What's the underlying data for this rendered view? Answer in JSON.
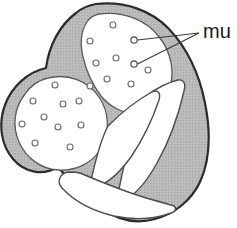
{
  "figure": {
    "kind": "anatomical-diagram",
    "title": ""
  },
  "colors": {
    "muscle_fill": "#b4b4b4",
    "muscle_fill_light": "#c2c2c2",
    "chamber_fill": "#ffffff",
    "outline": "#2b2b2b",
    "inner_outline": "#555555",
    "label_text": "#1a1a1a",
    "leader_line": "#3a3a3a",
    "marker_stroke": "#4a4a4a",
    "background": "#ffffff"
  },
  "labels": {
    "muscle": {
      "text": "mu",
      "note_clipped": "text runs past right edge of image",
      "x": 203,
      "y": 22,
      "font_size": 20
    }
  },
  "leaders": {
    "converge_point": {
      "x": 199,
      "y": 33
    },
    "lines": [
      {
        "name": "leader-upper",
        "x1": 199,
        "y1": 33,
        "x2": 137,
        "y2": 40
      },
      {
        "name": "leader-lower",
        "x1": 199,
        "y1": 33,
        "x2": 137,
        "y2": 64
      }
    ],
    "markers": [
      {
        "name": "marker-upper",
        "cx": 134,
        "cy": 40,
        "r": 3.2
      },
      {
        "name": "marker-lower",
        "cx": 134,
        "cy": 64,
        "r": 3.2
      }
    ]
  },
  "chambers": [
    {
      "name": "upper-right-chamber",
      "dot_count": 11,
      "dots": [
        {
          "cx": 113,
          "cy": 25
        },
        {
          "cx": 90,
          "cy": 40
        },
        {
          "cx": 134,
          "cy": 40
        },
        {
          "cx": 116,
          "cy": 59
        },
        {
          "cx": 96,
          "cy": 62
        },
        {
          "cx": 134,
          "cy": 64
        },
        {
          "cx": 107,
          "cy": 78
        },
        {
          "cx": 131,
          "cy": 85
        },
        {
          "cx": 109,
          "cy": 95
        },
        {
          "cx": 79,
          "cy": 82
        },
        {
          "cx": 150,
          "cy": 70
        }
      ]
    },
    {
      "name": "lower-left-chamber",
      "dot_count": 10,
      "dots": [
        {
          "cx": 54,
          "cy": 84
        },
        {
          "cx": 32,
          "cy": 101
        },
        {
          "cx": 63,
          "cy": 103
        },
        {
          "cx": 44,
          "cy": 116
        },
        {
          "cx": 78,
          "cy": 101
        },
        {
          "cx": 22,
          "cy": 124
        },
        {
          "cx": 58,
          "cy": 126
        },
        {
          "cx": 80,
          "cy": 124
        },
        {
          "cx": 34,
          "cy": 143
        },
        {
          "cx": 70,
          "cy": 146
        }
      ]
    }
  ],
  "dot_marker": {
    "radius": 3.0,
    "fill": "#ffffff",
    "stroke": "#6a6a6a",
    "stroke_width": 1.1
  },
  "geometry": {
    "outer_wall_path": "M 96 4 C 124 2 150 10 166 26 C 184 43 196 66 202 94 C 209 124 210 152 202 176 C 195 197 180 212 161 218 C 142 224 122 222 104 211 C 86 200 70 184 56 168 C 40 176 24 172 13 159 C 2 146 -1 126 5 107 C 11 88 26 74 44 69 C 47 47 58 26 74 14 C 80 9 88 6 96 4 Z",
    "upper_chamber_path": "M 97 15 C 121 13 143 21 156 38 C 167 52 171 70 166 86 C 161 100 150 108 137 110 C 124 112 112 106 104 96 C 96 86 90 74 86 62 C 82 50 80 37 84 27 C 86 21 91 17 97 15 Z",
    "lower_chamber_path": "M 47 79 C 66 75 85 82 95 97 C 105 112 105 131 96 146 C 88 159 74 166 59 165 C 43 164 29 154 22 140 C 15 125 16 108 26 95 C 31 87 39 81 47 79 Z",
    "ventricle_left_path": "M 113 120 C 128 108 145 96 160 88 C 166 85 170 89 168 95 C 163 111 154 129 142 145 C 131 159 118 170 106 174 C 99 176 96 171 99 164 C 103 150 106 133 113 120 Z",
    "ventricle_right_path": "M 154 100 C 166 92 178 86 187 84 C 192 83 194 88 192 94 C 187 114 179 138 167 159 C 157 177 145 191 134 197 C 128 200 125 195 127 188 C 133 160 142 126 154 100 Z",
    "ventricle_lower_path": "M 85 176 C 102 182 122 190 140 196 C 152 200 163 203 170 204 C 175 205 175 210 170 212 C 155 218 135 220 116 216 C 96 212 78 202 66 190 C 60 184 63 177 71 176 C 75 175 80 175 85 176 Z",
    "septum_notes": "V-shaped muscular septum separates upper and lower chambers from ventricular cavities"
  }
}
